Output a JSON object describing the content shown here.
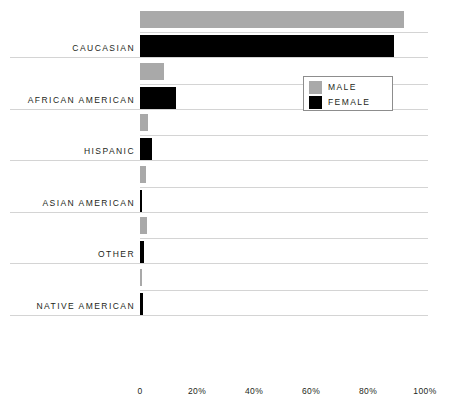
{
  "chart_data": {
    "type": "bar",
    "orientation": "horizontal",
    "title": "",
    "xlabel": "",
    "ylabel": "",
    "xlim": [
      0,
      100
    ],
    "grid": true,
    "legend_position": "upper-right-inset",
    "categories": [
      "CAUCASIAN",
      "AFRICAN AMERICAN",
      "HISPANIC",
      "ASIAN AMERICAN",
      "OTHER",
      "NATIVE AMERICAN"
    ],
    "tick_labels": [
      "0",
      "20%",
      "40%",
      "60%",
      "80%",
      "100%"
    ],
    "tick_values": [
      0,
      20,
      40,
      60,
      80,
      100
    ],
    "series": [
      {
        "name": "MALE",
        "color": "#a9a9a9",
        "values": [
          92.5,
          8.5,
          2.8,
          2.0,
          2.5,
          0.6
        ]
      },
      {
        "name": "FEMALE",
        "color": "#000000",
        "values": [
          89.0,
          12.5,
          4.2,
          0.3,
          1.3,
          1.1
        ]
      }
    ]
  },
  "legend": {
    "items": [
      {
        "label": "MALE",
        "swatch": "male-swatch"
      },
      {
        "label": "FEMALE",
        "swatch": "female-swatch"
      }
    ]
  }
}
